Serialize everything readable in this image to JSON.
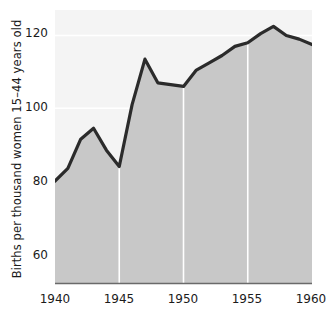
{
  "chart_data": {
    "type": "area",
    "title": "",
    "subtitle": "",
    "xlabel": "",
    "ylabel": "Births per thousand women 15–44 years old",
    "x": [
      1940,
      1941,
      1942,
      1943,
      1944,
      1945,
      1946,
      1947,
      1948,
      1949,
      1950,
      1951,
      1952,
      1953,
      1954,
      1955,
      1956,
      1957,
      1958,
      1959,
      1960
    ],
    "values": [
      80,
      83.5,
      91.5,
      94.5,
      88.5,
      84,
      101,
      113.5,
      107,
      106.5,
      106,
      110.5,
      112.5,
      114.5,
      117,
      118,
      120.5,
      122.5,
      120,
      119,
      117.5
    ],
    "series": [
      {
        "name": "Births per thousand women 15-44 years old",
        "values": [
          80,
          83.5,
          91.5,
          94.5,
          88.5,
          84,
          101,
          113.5,
          107,
          106.5,
          106,
          110.5,
          112.5,
          114.5,
          117,
          118,
          120.5,
          122.5,
          120,
          119,
          117.5
        ]
      }
    ],
    "xlim": [
      1940,
      1960
    ],
    "ylim": [
      52,
      127
    ],
    "ytick_labels": [
      "120",
      "100",
      "80",
      "60"
    ],
    "ytick_values": [
      120,
      100,
      80,
      60
    ],
    "xtick_labels": [
      "1940",
      "1945",
      "1950",
      "1955",
      "1960"
    ],
    "xtick_values": [
      1940,
      1945,
      1950,
      1955,
      1960
    ],
    "grid": "white gridlines, horizontal at y ticks and vertical at x ticks",
    "legend": "none",
    "annotations": []
  },
  "style": {
    "area_fill_color": "#c8c8c8",
    "line_color": "#2b2b2b",
    "gridline_color": "#ffffff",
    "background_color": "#ffffff",
    "text_color": "#1b1b1b",
    "axis_line_color": "#6a6a6a"
  },
  "axis": {
    "y_title": "Births per thousand women 15–44 years old",
    "ticks_y": [
      {
        "label": "120",
        "value": 120
      },
      {
        "label": "100",
        "value": 100
      },
      {
        "label": "80",
        "value": 80
      },
      {
        "label": "60",
        "value": 60
      }
    ],
    "ticks_x": [
      {
        "label": "1940",
        "value": 1940
      },
      {
        "label": "1945",
        "value": 1945
      },
      {
        "label": "1950",
        "value": 1950
      },
      {
        "label": "1955",
        "value": 1955
      },
      {
        "label": "1960",
        "value": 1960
      }
    ]
  }
}
